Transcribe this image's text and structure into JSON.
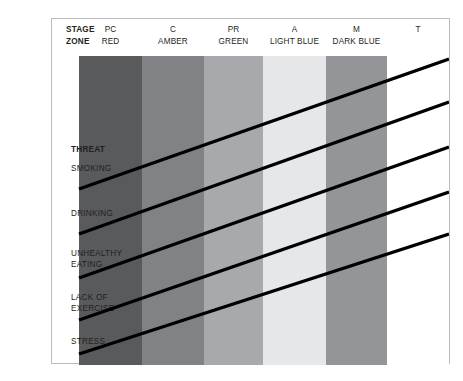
{
  "chart_data": {
    "type": "table",
    "xlabel": "STAGE / ZONE",
    "ylabel": "THREAT",
    "grid": false,
    "legend": "none",
    "categories": [
      "PC RED",
      "C AMBER",
      "PR GREEN",
      "A LIGHT BLUE",
      "M DARK BLUE",
      "T"
    ],
    "series": [
      {
        "name": "SMOKING",
        "values": [
          "PC",
          "C",
          "PR",
          "A",
          "M",
          "T"
        ]
      },
      {
        "name": "DRINKING",
        "values": [
          "PC",
          "C",
          "PR",
          "A",
          "M",
          "T"
        ]
      },
      {
        "name": "UNHEALTHY EATING",
        "values": [
          "PC",
          "C",
          "PR",
          "A",
          "M",
          "T"
        ]
      },
      {
        "name": "LACK OF EXERCISE",
        "values": [
          "PC",
          "C",
          "PR",
          "A",
          "M",
          "T"
        ]
      },
      {
        "name": "STRESS",
        "values": [
          "PC",
          "C",
          "PR",
          "A",
          "M",
          "T"
        ]
      }
    ],
    "annotations": [
      "Each threat is drawn as an ascending diagonal progression line running from the PC zone up through the T zone."
    ]
  },
  "header": {
    "stage_line1": "STAGE",
    "stage_line2": "ZONE",
    "columns": [
      {
        "stage": "PC",
        "zone": "RED",
        "color": "#595a5c",
        "x": 27,
        "w": 63
      },
      {
        "stage": "C",
        "zone": "AMBER",
        "color": "#808285",
        "x": 90,
        "w": 62
      },
      {
        "stage": "PR",
        "zone": "GREEN",
        "color": "#a7a9ac",
        "x": 152,
        "w": 59
      },
      {
        "stage": "A",
        "zone": "LIGHT BLUE",
        "color": "#e6e7e8",
        "x": 211,
        "w": 63
      },
      {
        "stage": "M",
        "zone": "DARK BLUE",
        "color": "#939598",
        "x": 274,
        "w": 61
      },
      {
        "stage": "T",
        "zone": "",
        "color": "#ffffff",
        "x": 335,
        "w": 62
      }
    ]
  },
  "rows": {
    "threat_heading": "THREAT",
    "items": [
      {
        "label": "SMOKING",
        "y": 163
      },
      {
        "label": "DRINKING",
        "y": 208
      },
      {
        "label": "UNHEALTHY\nEATING",
        "y": 248
      },
      {
        "label": "LACK OF\nEXERCISE",
        "y": 292
      },
      {
        "label": "STRESS",
        "y": 336
      }
    ]
  },
  "lines": {
    "color": "#000000",
    "width": 3.4,
    "segments": [
      {
        "x1": 27,
        "y1": 170,
        "x2": 397,
        "y2": 40
      },
      {
        "x1": 27,
        "y1": 215,
        "x2": 397,
        "y2": 83
      },
      {
        "x1": 27,
        "y1": 259,
        "x2": 397,
        "y2": 128
      },
      {
        "x1": 27,
        "y1": 301,
        "x2": 397,
        "y2": 173
      },
      {
        "x1": 27,
        "y1": 335,
        "x2": 397,
        "y2": 215
      }
    ]
  }
}
